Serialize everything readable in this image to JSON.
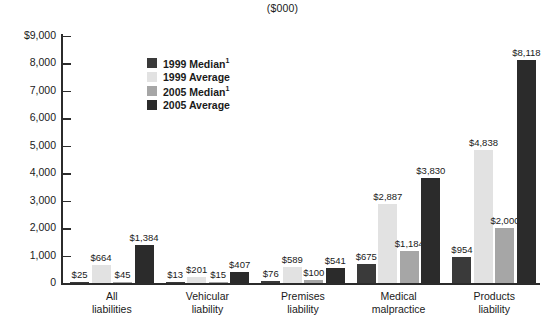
{
  "chart_data": {
    "type": "bar",
    "title": "($000)",
    "xlabel": "",
    "ylabel": "",
    "ylim": [
      0,
      9000
    ],
    "ytick_labels": [
      "$9,000",
      "8,000",
      "7,000",
      "6,000",
      "5,000",
      "4,000",
      "3,000",
      "2,000",
      "1,000",
      "0"
    ],
    "ytick_values": [
      9000,
      8000,
      7000,
      6000,
      5000,
      4000,
      3000,
      2000,
      1000,
      0
    ],
    "grid": false,
    "legend_position": "upper-left-inside",
    "categories": [
      "All liabilities",
      "Vehicular liability",
      "Premises liability",
      "Medical malpractice",
      "Products liability"
    ],
    "category_lines": [
      [
        "All",
        "liabilities"
      ],
      [
        "Vehicular",
        "liability"
      ],
      [
        "Premises",
        "liability"
      ],
      [
        "Medical",
        "malpractice"
      ],
      [
        "Products",
        "liability"
      ]
    ],
    "series": [
      {
        "name": "1999 Median",
        "superscript": "1",
        "color": "#3a3a3a",
        "values": [
          25,
          13,
          76,
          675,
          954
        ],
        "labels": [
          "$25",
          "$13",
          "$76",
          "$675",
          "$954"
        ]
      },
      {
        "name": "1999 Average",
        "superscript": "",
        "color": "#e2e2e2",
        "values": [
          664,
          201,
          589,
          2887,
          4838
        ],
        "labels": [
          "$664",
          "$201",
          "$589",
          "$2,887",
          "$4,838"
        ]
      },
      {
        "name": "2005 Median",
        "superscript": "1",
        "color": "#a6a6a6",
        "values": [
          45,
          15,
          100,
          1184,
          2000
        ],
        "labels": [
          "$45",
          "$15",
          "$100",
          "$1,184",
          "$2,000"
        ]
      },
      {
        "name": "2005 Average",
        "superscript": "",
        "color": "#2b2b2b",
        "values": [
          1384,
          407,
          541,
          3830,
          8118
        ],
        "labels": [
          "$1,384",
          "$407",
          "$541",
          "$3,830",
          "$8,118"
        ]
      }
    ]
  }
}
